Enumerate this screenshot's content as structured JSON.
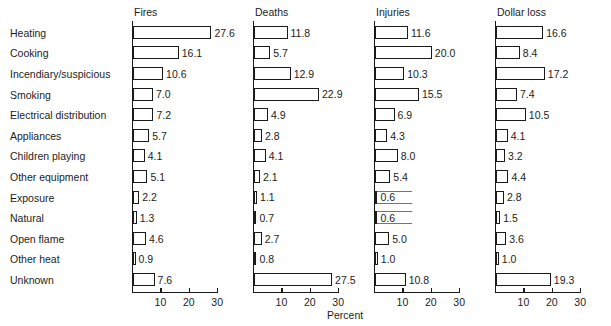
{
  "chart_data": {
    "type": "bar",
    "title": "",
    "subtitle": "",
    "orientation": "horizontal",
    "layout": "small-multiples, 4 panels sharing one category axis",
    "xlabel": "Percent",
    "ylabel": "",
    "xlim": [
      0,
      32
    ],
    "xticks": [
      10,
      20,
      30
    ],
    "xtick_labels": [
      "10",
      "20",
      "30"
    ],
    "grid": false,
    "legend_position": "none",
    "categories": [
      "Heating",
      "Cooking",
      "Incendiary/suspicious",
      "Smoking",
      "Electrical distribution",
      "Appliances",
      "Children playing",
      "Other equipment",
      "Exposure",
      "Natural",
      "Open flame",
      "Other heat",
      "Unknown"
    ],
    "series": [
      {
        "name": "Fires",
        "values": [
          27.6,
          16.1,
          10.6,
          7.0,
          7.2,
          5.7,
          4.1,
          5.1,
          2.2,
          1.3,
          4.6,
          0.9,
          7.6
        ],
        "labels": [
          "27.6",
          "16.1",
          "10.6",
          "7.0",
          "7.2",
          "5.7",
          "4.1",
          "5.1",
          "2.2",
          "1.3",
          "4.6",
          "0.9",
          "7.6"
        ]
      },
      {
        "name": "Deaths",
        "values": [
          11.8,
          5.7,
          12.9,
          22.9,
          4.9,
          2.8,
          4.1,
          2.1,
          1.1,
          0.7,
          2.7,
          0.8,
          27.5
        ],
        "labels": [
          "11.8",
          "5.7",
          "12.9",
          "22.9",
          "4.9",
          "2.8",
          "4.1",
          "2.1",
          "1.1",
          "0.7",
          "2.7",
          "0.8",
          "27.5"
        ]
      },
      {
        "name": "Injuries",
        "values": [
          11.6,
          20.0,
          10.3,
          15.5,
          6.9,
          4.3,
          8.0,
          5.4,
          0.6,
          0.6,
          5.0,
          1.0,
          10.8
        ],
        "labels": [
          "11.6",
          "20.0",
          "10.3",
          "15.5",
          "6.9",
          "4.3",
          "8.0",
          "5.4",
          "0.6",
          "0.6",
          "5.0",
          "1.0",
          "10.8"
        ]
      },
      {
        "name": "Dollar loss",
        "values": [
          16.6,
          8.4,
          17.2,
          7.4,
          10.5,
          4.1,
          3.2,
          4.4,
          2.8,
          1.5,
          3.6,
          1.0,
          19.3
        ],
        "labels": [
          "16.6",
          "8.4",
          "17.2",
          "7.4",
          "10.5",
          "4.1",
          "3.2",
          "4.4",
          "2.8",
          "1.5",
          "3.6",
          "1.0",
          "19.3"
        ]
      }
    ]
  },
  "panels": [
    {
      "title": "Fires"
    },
    {
      "title": "Deaths"
    },
    {
      "title": "Injuries"
    },
    {
      "title": "Dollar loss"
    }
  ],
  "axis": {
    "caption": "Percent",
    "tick_labels": [
      "10",
      "20",
      "30"
    ]
  }
}
